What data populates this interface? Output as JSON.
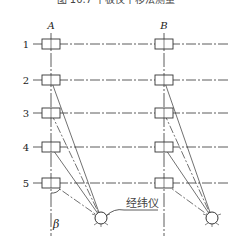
{
  "caption": "图 10.7  平板仪平移法测量",
  "axes": [
    {
      "label": "A",
      "x": 51
    },
    {
      "label": "B",
      "x": 164
    }
  ],
  "rows": [
    {
      "label": "1",
      "y": 44
    },
    {
      "label": "2",
      "y": 80
    },
    {
      "label": "3",
      "y": 113
    },
    {
      "label": "4",
      "y": 147
    },
    {
      "label": "5",
      "y": 183
    }
  ],
  "instruments": [
    {
      "x": 101,
      "y": 218
    },
    {
      "x": 212,
      "y": 218
    }
  ],
  "instrument_label": "经纬仪",
  "angle_label": "β",
  "colors": {
    "line": "#333333",
    "background": "#ffffff"
  }
}
